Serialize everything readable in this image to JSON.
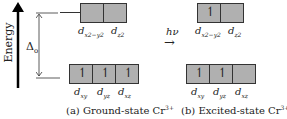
{
  "axis": {
    "label": "Energy"
  },
  "delta": {
    "label": "Δ",
    "sub": "o"
  },
  "transition": {
    "label": "hν",
    "arrow": "→"
  },
  "ground": {
    "eg": [
      {
        "name": "d",
        "sub": "x2−y2",
        "electron": false
      },
      {
        "name": "d",
        "sub": "z2",
        "electron": false
      }
    ],
    "t2g": [
      {
        "name": "d",
        "sub": "xy",
        "electron": true
      },
      {
        "name": "d",
        "sub": "yz",
        "electron": true
      },
      {
        "name": "d",
        "sub": "xz",
        "electron": true
      }
    ],
    "caption": "(a) Ground-state Cr",
    "caption_sup": "3+"
  },
  "excited": {
    "eg": [
      {
        "name": "d",
        "sub": "x2−y2",
        "electron": true
      },
      {
        "name": "d",
        "sub": "z2",
        "electron": false
      }
    ],
    "t2g": [
      {
        "name": "d",
        "sub": "xy",
        "electron": true
      },
      {
        "name": "d",
        "sub": "yz",
        "electron": true
      },
      {
        "name": "d",
        "sub": "xz",
        "electron": false
      }
    ],
    "caption": "(b) Excited-state Cr",
    "caption_sup": "3+"
  }
}
